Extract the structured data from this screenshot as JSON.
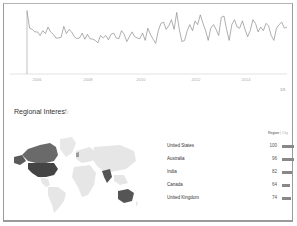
{
  "chart_data": [
    {
      "type": "line",
      "title": "",
      "xlabel": "",
      "ylabel": "",
      "x_ticks": [
        "2006",
        "2008",
        "2010",
        "2012",
        "2014"
      ],
      "ylim": [
        0,
        100
      ],
      "grid": false,
      "series": [
        {
          "name": "Interest over time",
          "values": [
            100,
            72,
            70,
            66,
            66,
            60,
            68,
            63,
            74,
            66,
            62,
            56,
            56,
            57,
            75,
            63,
            70,
            66,
            58,
            55,
            56,
            64,
            54,
            62,
            55,
            54,
            52,
            48,
            60,
            56,
            60,
            53,
            62,
            64,
            56,
            55,
            68,
            62,
            50,
            58,
            66,
            58,
            56,
            55,
            64,
            52,
            72,
            62,
            54,
            47,
            68,
            80,
            82,
            70,
            76,
            86,
            70,
            98,
            70,
            50,
            52,
            68,
            78,
            68,
            84,
            78,
            94,
            80,
            68,
            52,
            72,
            78,
            70,
            60,
            90,
            92,
            70,
            52,
            78,
            86,
            74,
            72,
            84,
            70,
            58,
            68,
            86,
            80,
            66,
            74,
            68,
            80,
            76,
            60,
            52,
            72,
            78,
            82,
            72,
            74
          ]
        }
      ],
      "annotations": [
        "Interest over time line chart",
        "1/5"
      ]
    },
    {
      "type": "bar",
      "title": "Regional Interest",
      "categories": [
        "United States",
        "Australia",
        "India",
        "Canada",
        "United Kingdom"
      ],
      "values": [
        100,
        96,
        82,
        64,
        74
      ],
      "xlabel": "",
      "ylabel": "",
      "ylim": [
        0,
        100
      ]
    }
  ],
  "chart": {
    "more_label": "1/5",
    "x_ticks": [
      "2006",
      "2008",
      "2010",
      "2012",
      "2014"
    ]
  },
  "regional": {
    "title": "Regional Interest",
    "tabs": {
      "active": "Region",
      "separator": "|",
      "inactive": "City"
    },
    "rows": [
      {
        "name": "United States",
        "value": "100",
        "bar": 100
      },
      {
        "name": "Australia",
        "value": "96",
        "bar": 96
      },
      {
        "name": "India",
        "value": "82",
        "bar": 82
      },
      {
        "name": "Canada",
        "value": "64",
        "bar": 64
      },
      {
        "name": "United Kingdom",
        "value": "74",
        "bar": 74
      }
    ],
    "colors": {
      "highlight": "#555555",
      "land": "#e6e6e6",
      "bar": "#888888",
      "line": "#9a9a9a"
    }
  }
}
